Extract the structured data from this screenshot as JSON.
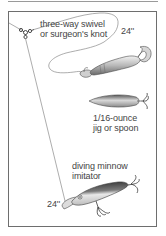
{
  "diagram": {
    "type": "fishing-rig-illustration",
    "labels": {
      "swivel": {
        "line1": "three-way swivel",
        "line2": "or surgeon's knot"
      },
      "upper_leader_length": "24''",
      "jig": {
        "line1": "1/16-ounce",
        "line2": "jig or spoon"
      },
      "minnow": {
        "line1": "diving minnow",
        "line2": "imitator"
      },
      "lower_leader_length": "24''"
    },
    "components": [
      "main-line",
      "three-way-swivel",
      "upper-leader",
      "soft-plastic-grub",
      "spoon",
      "lower-leader",
      "diving-minnow-lure"
    ],
    "colors": {
      "line": "#7a7a7a",
      "border": "#6e6e6e",
      "text": "#444444",
      "lure_dark": "#3a3a3a",
      "lure_mid": "#9a9a9a",
      "lure_light": "#e2e2e2"
    }
  }
}
